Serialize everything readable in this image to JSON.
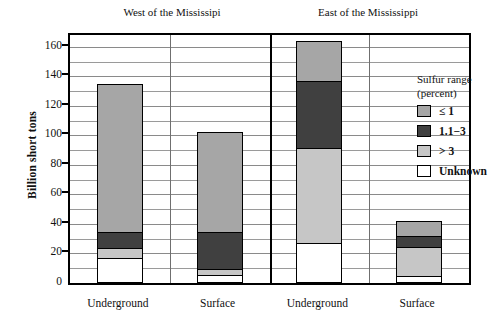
{
  "figure": {
    "ylabel": "Billion short tons",
    "panels": [
      {
        "id": "west",
        "title": "West of the Mississipi"
      },
      {
        "id": "east",
        "title": "East of the Mississippi"
      }
    ]
  },
  "legend": {
    "title": "Sulfur range",
    "subtitle": "(percent)",
    "items": [
      {
        "label": "≤ 1",
        "color": "#a6a6a6"
      },
      {
        "label": "1.1−3",
        "color": "#404040"
      },
      {
        "label": "> 3",
        "color": "#c6c6c6"
      },
      {
        "label": "Unknown",
        "color": "#ffffff"
      }
    ]
  },
  "axis": {
    "yticks": [
      0,
      20,
      40,
      60,
      80,
      100,
      120,
      140,
      160
    ],
    "ytick_labels": [
      "0",
      "20",
      "40",
      "60",
      "80",
      "100",
      "120",
      "140",
      "160"
    ],
    "ymin": 0,
    "ymax": 168,
    "minor_step": 10
  },
  "xlabels": [
    "Underground",
    "Surface",
    "Underground",
    "Surface"
  ],
  "chart_data": {
    "type": "bar",
    "title": "",
    "subtitle": "",
    "xlabel": "",
    "ylabel": "Billion short tons",
    "ylim": [
      0,
      168
    ],
    "grid": true,
    "stacked": true,
    "legend_position": "upper right inside plot",
    "legend_title": "Sulfur range (percent)",
    "panels": [
      "West of the Mississipi",
      "East of the Mississippi"
    ],
    "categories": [
      "Underground (West)",
      "Surface (West)",
      "Underground (East)",
      "Surface (East)"
    ],
    "series": [
      {
        "name": "Unknown",
        "color": "#ffffff",
        "values": [
          16,
          4,
          26,
          4
        ]
      },
      {
        "name": "> 3",
        "color": "#c6c6c6",
        "values": [
          6,
          4,
          65,
          20
        ]
      },
      {
        "name": "1.1−3",
        "color": "#404040",
        "values": [
          11,
          25,
          46,
          8
        ]
      },
      {
        "name": "≤ 1",
        "color": "#a6a6a6",
        "values": [
          102,
          69,
          27,
          10
        ]
      }
    ],
    "totals": [
      135,
      102,
      164,
      42
    ],
    "units": "billion short tons"
  }
}
